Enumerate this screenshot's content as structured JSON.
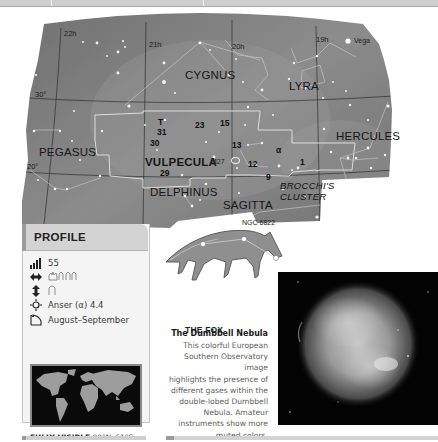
{
  "star_map": {
    "grid_labels": {
      "ra": [
        "22h",
        "21h",
        "20h",
        "19h"
      ],
      "dec": [
        "30°",
        "20°"
      ]
    },
    "constellations": [
      {
        "name": "CYGNUS",
        "highlight": false
      },
      {
        "name": "LYRA",
        "highlight": false
      },
      {
        "name": "PEGASUS",
        "highlight": false
      },
      {
        "name": "VULPECULA",
        "highlight": true
      },
      {
        "name": "HERCULES",
        "highlight": false
      },
      {
        "name": "DELPHINUS",
        "highlight": false
      },
      {
        "name": "SAGITTA",
        "highlight": false
      }
    ],
    "star_names": [
      "Vega"
    ],
    "star_designations": [
      "T",
      "31",
      "30",
      "23",
      "15",
      "13",
      "12",
      "α",
      "1",
      "9",
      "29"
    ],
    "deep_sky_objects": [
      "M27",
      "NGC 6822"
    ],
    "asterisms": [
      "BROCCHI'S",
      "CLUSTER"
    ]
  },
  "figure": {
    "title": "THE FOX"
  },
  "profile": {
    "title": "PROFILE",
    "rows": [
      {
        "icon": "size-rank-icon",
        "value": "55"
      },
      {
        "icon": "width-arrows-icon",
        "value": "hands-span-3"
      },
      {
        "icon": "height-arrows-icon",
        "value": "hand-span-1"
      },
      {
        "icon": "brightest-star-icon",
        "value": "Anser (α) 4.4"
      },
      {
        "icon": "best-viewing-icon",
        "value": "August–September"
      }
    ],
    "visibility_label": "FULLY VISIBLE",
    "visibility_range": "90°N–61°S"
  },
  "caption": {
    "title": "The Dumbbell Nebula",
    "lines": [
      "This colorful European",
      "Southern Observatory image",
      "highlights the presence of",
      "different gases within the",
      "double-lobed Dumbbell",
      "Nebula. Amateur",
      "instruments show more",
      "muted colors."
    ]
  },
  "colors": {
    "map_bg": "#7d7d7d",
    "profile_header": "#d3d3d3",
    "profile_accent": "#9a9a9a",
    "nebula_bg": "#030303"
  }
}
